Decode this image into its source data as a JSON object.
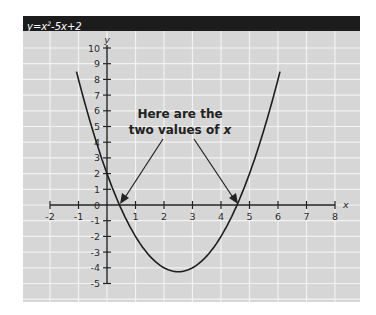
{
  "header": {
    "equation_prefix": "y=x",
    "equation_exp": "2",
    "equation_suffix": "-5x+2"
  },
  "annotation": {
    "line1": "Here are the",
    "line2_prefix": "two values of ",
    "line2_var": "x"
  },
  "colors": {
    "header_bg": "#1c1c1c",
    "panel_bg": "#d6d6d6",
    "grid": "#f2f2f2",
    "curve": "#1e1e1e"
  },
  "chart_data": {
    "type": "line",
    "xlabel": "x",
    "ylabel": "y",
    "xlim": [
      -2,
      8
    ],
    "ylim": [
      -5,
      10
    ],
    "grid": true,
    "x_ticks": [
      "-2",
      "-1",
      "1",
      "2",
      "3",
      "4",
      "5",
      "6",
      "7",
      "8"
    ],
    "y_ticks": [
      "10",
      "9",
      "8",
      "7",
      "6",
      "5",
      "4",
      "3",
      "2",
      "1",
      "0",
      "-1",
      "-2",
      "-3",
      "-4",
      "-5"
    ],
    "series": [
      {
        "name": "y=x^2-5x+2",
        "x": [
          -1.07,
          -1,
          -0.5,
          0,
          0.44,
          1,
          1.5,
          2,
          2.5,
          3,
          3.5,
          4,
          4.56,
          5,
          5.5,
          6,
          6.07
        ],
        "y": [
          8,
          8,
          4.75,
          2,
          0,
          -2,
          -3.25,
          -4,
          -4.25,
          -4,
          -3.25,
          -2,
          0,
          2,
          4.75,
          8,
          8
        ]
      }
    ],
    "annotations": [
      {
        "text": "Here are the two values of x",
        "points_to": [
          [
            0.44,
            0
          ],
          [
            4.56,
            0
          ]
        ]
      }
    ],
    "roots": [
      0.44,
      4.56
    ],
    "vertex": [
      2.5,
      -4.25
    ]
  }
}
